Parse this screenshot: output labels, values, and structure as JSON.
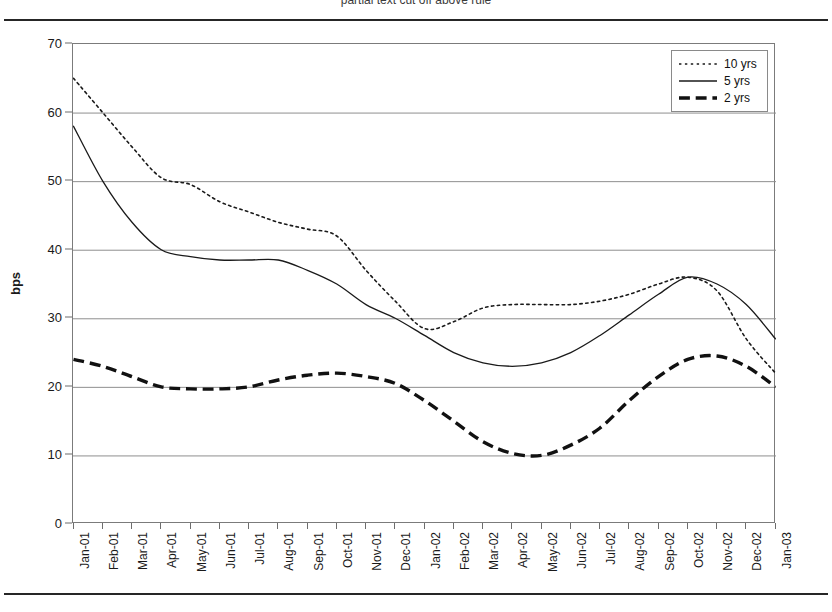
{
  "page": {
    "caption_fragment": "partial text cut off above rule"
  },
  "chart_data": {
    "type": "line",
    "title": "",
    "subtitle": "",
    "xlabel": "",
    "ylabel": "bps",
    "ylim": [
      0,
      70
    ],
    "ytick_step": 10,
    "yticks": [
      0,
      10,
      20,
      30,
      40,
      50,
      60,
      70
    ],
    "grid": "horizontal",
    "legend_position": "top-right",
    "categories": [
      "Jan-01",
      "Feb-01",
      "Mar-01",
      "Apr-01",
      "May-01",
      "Jun-01",
      "Jul-01",
      "Aug-01",
      "Sep-01",
      "Oct-01",
      "Nov-01",
      "Dec-01",
      "Jan-02",
      "Feb-02",
      "Mar-02",
      "Apr-02",
      "May-02",
      "Jun-02",
      "Jul-02",
      "Aug-02",
      "Sep-02",
      "Oct-02",
      "Nov-02",
      "Dec-02",
      "Jan-03"
    ],
    "series": [
      {
        "name": "10 yrs",
        "style": "dotted",
        "color": "#1a1a1a",
        "width": 1.6,
        "values": [
          65,
          60,
          55,
          50.5,
          49.5,
          47,
          45.5,
          44,
          43,
          42,
          37,
          32.5,
          28.5,
          29.5,
          31.5,
          32,
          32,
          32,
          32.5,
          33.5,
          35,
          36,
          34,
          27,
          22
        ]
      },
      {
        "name": "5 yrs",
        "style": "solid",
        "color": "#1a1a1a",
        "width": 1.3,
        "values": [
          58,
          50,
          44,
          40,
          39,
          38.5,
          38.5,
          38.5,
          37,
          35,
          32,
          30,
          27.5,
          25,
          23.5,
          23,
          23.5,
          25,
          27.5,
          30.5,
          33.5,
          36,
          35,
          32,
          27
        ]
      },
      {
        "name": "2 yrs",
        "style": "dashed",
        "color": "#111111",
        "width": 3.4,
        "values": [
          24,
          23,
          21.5,
          20,
          19.7,
          19.7,
          20,
          21,
          21.7,
          22,
          21.5,
          20.5,
          18,
          15,
          12,
          10.3,
          10,
          11.5,
          14,
          18,
          21.5,
          24,
          24.5,
          23,
          20
        ]
      }
    ]
  },
  "legend": {
    "items": [
      {
        "label": "10 yrs",
        "style": "dotted"
      },
      {
        "label": "5 yrs",
        "style": "solid"
      },
      {
        "label": "2 yrs",
        "style": "dashed"
      }
    ]
  }
}
